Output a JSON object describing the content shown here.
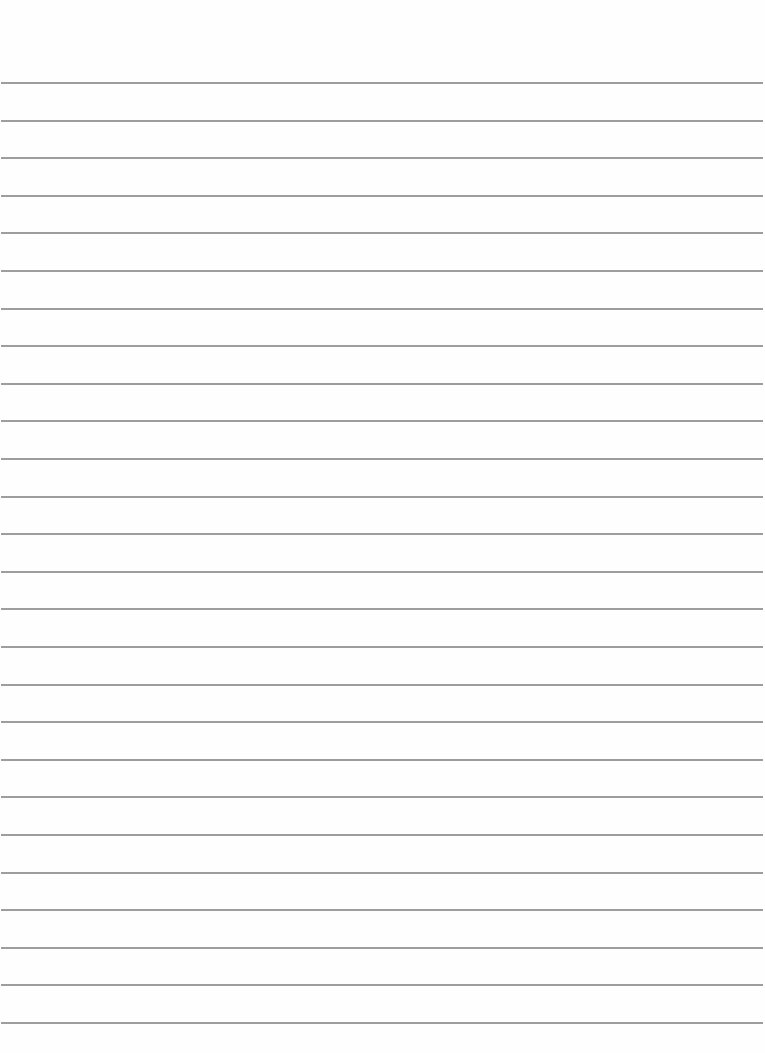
{
  "page": {
    "type": "lined-paper",
    "background": "#fefefe",
    "line_color": "#8c8c8c",
    "line_count": 26,
    "first_line_y": 82,
    "line_spacing": 37.6,
    "text": ""
  }
}
